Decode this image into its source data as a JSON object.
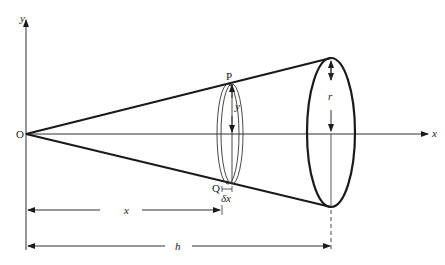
{
  "diagram": {
    "type": "cone-volume-of-revolution",
    "labels": {
      "y_axis": "y",
      "x_axis": "x",
      "origin": "O",
      "point_P": "P",
      "point_Q": "Q",
      "slice_radius": "y",
      "slice_width": "δx",
      "base_radius": "r",
      "distance_x": "x",
      "height": "h"
    },
    "colors": {
      "stroke": "#1a1a1a",
      "background": "#ffffff"
    }
  }
}
